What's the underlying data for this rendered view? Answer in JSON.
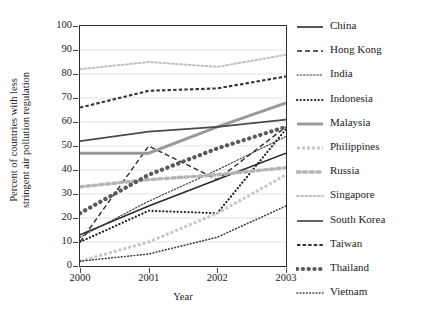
{
  "chart_data": {
    "type": "line",
    "title": "",
    "xlabel": "Year",
    "ylabel": "Percent of countries with less stringent air pollution regulation",
    "ylabel_line1": "Percent of countries with less",
    "ylabel_line2": "stringent air pollution regulation",
    "categories": [
      "2000",
      "2001",
      "2002",
      "2003"
    ],
    "x": [
      2000,
      2001,
      2002,
      2003
    ],
    "xlim": [
      2000,
      2003
    ],
    "ylim": [
      0,
      100
    ],
    "yticks": [
      0,
      10,
      20,
      30,
      40,
      50,
      60,
      70,
      80,
      90,
      100
    ],
    "xticks": [
      "2000",
      "2001",
      "2002",
      "2003"
    ],
    "grid": "horizontal",
    "legend_position": "right",
    "series": [
      {
        "name": "China",
        "values": [
          13,
          25,
          36,
          47
        ],
        "color": "#2b2b2b",
        "style": "solid",
        "width": 1.6,
        "dash": ""
      },
      {
        "name": "Hong Kong",
        "values": [
          10,
          50,
          36,
          58
        ],
        "color": "#2b2b2b",
        "style": "dashed",
        "width": 1.4,
        "dash": "5,3"
      },
      {
        "name": "India",
        "values": [
          12,
          27,
          40,
          54
        ],
        "color": "#3a3a3a",
        "style": "dotted-fine",
        "width": 1.1,
        "dash": "1.5,1.8"
      },
      {
        "name": "Indonesia",
        "values": [
          10,
          23,
          22,
          57
        ],
        "color": "#1f1f1f",
        "style": "dotted-bold",
        "width": 2.1,
        "dash": "0.2,3.4"
      },
      {
        "name": "Malaysia",
        "values": [
          47,
          47,
          58,
          68
        ],
        "color": "#9a9a9a",
        "style": "solid",
        "width": 3.0,
        "dash": ""
      },
      {
        "name": "Philippines",
        "values": [
          2,
          10,
          22,
          38
        ],
        "color": "#c8c8c8",
        "style": "dashed",
        "width": 3.0,
        "dash": "3,2"
      },
      {
        "name": "Russia",
        "values": [
          33,
          36,
          38,
          41
        ],
        "color": "#b4b4b4",
        "style": "dotted-square",
        "width": 3.4,
        "dash": "3.2,3.4"
      },
      {
        "name": "Singapore",
        "values": [
          82,
          85,
          83,
          88
        ],
        "color": "#c0c0c0",
        "style": "dotted",
        "width": 2.0,
        "dash": "1.8,2.4"
      },
      {
        "name": "South Korea",
        "values": [
          52,
          56,
          58,
          61
        ],
        "color": "#4a4a4a",
        "style": "solid",
        "width": 1.7,
        "dash": ""
      },
      {
        "name": "Taiwan",
        "values": [
          66,
          73,
          74,
          79
        ],
        "color": "#333333",
        "style": "dashed",
        "width": 2.1,
        "dash": "3.4,2.2"
      },
      {
        "name": "Thailand",
        "values": [
          22,
          38,
          49,
          58
        ],
        "color": "#5a5a5a",
        "style": "dotted-large",
        "width": 4.2,
        "dash": "0.2,5.6"
      },
      {
        "name": "Vietnam",
        "values": [
          2,
          5,
          12,
          25
        ],
        "color": "#3a3a3a",
        "style": "dotted-fine",
        "width": 1.6,
        "dash": "0.6,2.6"
      }
    ]
  },
  "legend": {
    "items": [
      {
        "label": "China"
      },
      {
        "label": "Hong Kong"
      },
      {
        "label": "India"
      },
      {
        "label": "Indonesia"
      },
      {
        "label": "Malaysia"
      },
      {
        "label": "Philippines"
      },
      {
        "label": "Russia"
      },
      {
        "label": "Singapore"
      },
      {
        "label": "South Korea"
      },
      {
        "label": "Taiwan"
      },
      {
        "label": "Thailand"
      },
      {
        "label": "Vietnam"
      }
    ]
  }
}
